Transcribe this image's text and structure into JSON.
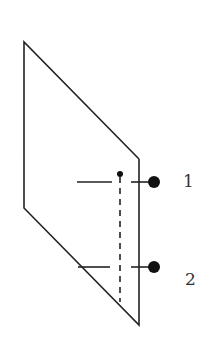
{
  "diagram": {
    "stroke_color": "#222222",
    "labels": [
      {
        "id": "line-1",
        "text": "1"
      },
      {
        "id": "line-2",
        "text": "2"
      }
    ]
  }
}
